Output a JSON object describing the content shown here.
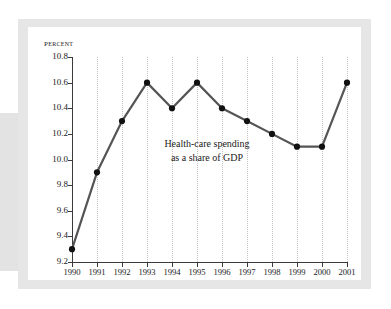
{
  "figure": {
    "background_color": "#ffffff",
    "card_color": "#ffffff",
    "mat_color": "#e6e6e6",
    "band_color": "#e3e3e3"
  },
  "chart_data": {
    "type": "line",
    "title": "",
    "ylabel": "Percent",
    "xlabel": "",
    "categories": [
      "1990",
      "1991",
      "1992",
      "1993",
      "1994",
      "1995",
      "1996",
      "1997",
      "1998",
      "1999",
      "2000",
      "2001"
    ],
    "values": [
      9.3,
      9.9,
      10.3,
      10.6,
      10.4,
      10.6,
      10.4,
      10.3,
      10.2,
      10.1,
      10.1,
      10.6
    ],
    "series": [
      {
        "name": "Health-care spending as a share of GDP",
        "values": [
          9.3,
          9.9,
          10.3,
          10.6,
          10.4,
          10.6,
          10.4,
          10.3,
          10.2,
          10.1,
          10.1,
          10.6
        ]
      }
    ],
    "ylim": [
      9.2,
      10.8
    ],
    "ytick_labels": [
      "10.8",
      "10.6",
      "10.4",
      "10.2",
      "10.0",
      "9.8",
      "9.6",
      "9.4",
      "9.2"
    ],
    "ytick_values": [
      10.8,
      10.6,
      10.4,
      10.2,
      10.0,
      9.8,
      9.6,
      9.4,
      9.2
    ],
    "xtick_labels": [
      "1990",
      "1991",
      "1992",
      "1993",
      "1994",
      "1995",
      "1996",
      "1997",
      "1998",
      "1999",
      "2000",
      "2001"
    ],
    "grid": "vertical-dotted",
    "legend": "none",
    "line_color": "#555555",
    "marker_color": "#111111",
    "annotations": [
      {
        "line1": "Health-care spending",
        "line2": "as a share of GDP"
      }
    ]
  }
}
